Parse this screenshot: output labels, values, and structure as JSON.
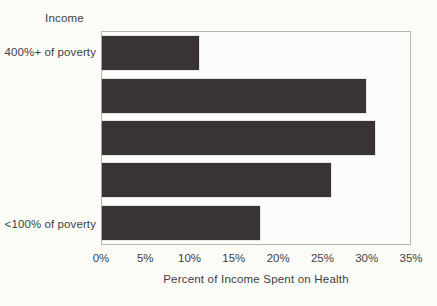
{
  "chart_data": {
    "type": "bar",
    "orientation": "horizontal",
    "title": "",
    "axis_header": "Income",
    "xlabel": "Percent of Income Spent on Health",
    "categories": [
      "400%+ of poverty",
      "",
      "",
      "",
      "<100% of poverty"
    ],
    "values": [
      11,
      30,
      31,
      26,
      18
    ],
    "xlim": [
      0,
      35
    ],
    "xticks": [
      "0%",
      "5%",
      "10%",
      "15%",
      "20%",
      "25%",
      "30%",
      "35%"
    ],
    "legend": "none",
    "grid": "off",
    "bar_color": "#3a3335",
    "frame_color": "#b4b4b0",
    "background_color": "#fbfbf8"
  }
}
